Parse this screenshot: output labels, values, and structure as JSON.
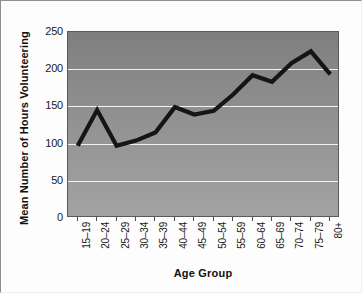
{
  "chart_data": {
    "type": "line",
    "title": "",
    "xlabel": "Age Group",
    "ylabel": "Mean Number of Hours Volunteering",
    "categories": [
      "15–19",
      "20–24",
      "25–29",
      "30–34",
      "35–39",
      "40–44",
      "45–49",
      "50–54",
      "55–59",
      "60–64",
      "65–69",
      "70–74",
      "75–79",
      "80+"
    ],
    "values": [
      97,
      145,
      97,
      104,
      115,
      149,
      139,
      144,
      166,
      192,
      183,
      208,
      224,
      193
    ],
    "yticks": [
      "0",
      "50",
      "100",
      "150",
      "200",
      "250"
    ],
    "ytick_values": [
      0,
      50,
      100,
      150,
      200,
      250
    ],
    "ylim": [
      0,
      250
    ],
    "grid": "horizontal",
    "legend": "none",
    "series_color": "#151515",
    "plot_background": "#8d8d8d",
    "gridline_color": "#f2f2f2"
  }
}
